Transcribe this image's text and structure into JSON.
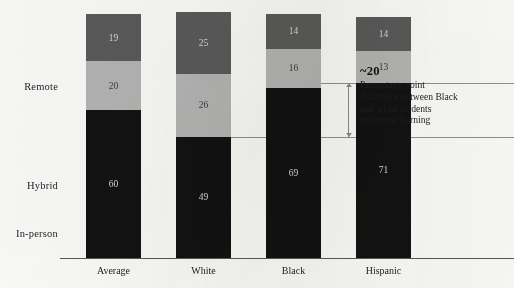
{
  "chart_data": {
    "type": "bar",
    "subtype": "100% stacked bar",
    "title": "",
    "xlabel": "",
    "ylabel": "",
    "ylim": [
      0,
      100
    ],
    "grid": false,
    "legend_position": "left-row-labels",
    "categories": [
      "Average",
      "White",
      "Black",
      "Hispanic"
    ],
    "series": [
      {
        "name": "In-person",
        "color": "#5a5a5a",
        "values": [
          19,
          25,
          14,
          14
        ]
      },
      {
        "name": "Hybrid",
        "color": "#b5b5b5",
        "values": [
          20,
          26,
          16,
          13
        ]
      },
      {
        "name": "Remote",
        "color": "#121212",
        "values": [
          60,
          49,
          69,
          71
        ]
      }
    ],
    "annotations": [
      {
        "value": "~20",
        "text": "Percentage-point difference between Black and white students in remote learning",
        "text_lines": [
          "Percentage-point",
          "difference between Black",
          "and white students",
          "in remote learning"
        ],
        "span_from_category": "White",
        "span_to_category": "Hispanic",
        "marker": "double-arrow"
      }
    ]
  },
  "row_labels": [
    {
      "name": "In-person",
      "label": "In-person"
    },
    {
      "name": "Hybrid",
      "label": "Hybrid"
    },
    {
      "name": "Remote",
      "label": "Remote"
    }
  ],
  "bars": [
    {
      "category": "Average",
      "segments": [
        {
          "series": "In-person",
          "value": 19,
          "label": "19"
        },
        {
          "series": "Hybrid",
          "value": 20,
          "label": "20"
        },
        {
          "series": "Remote",
          "value": 60,
          "label": "60"
        }
      ]
    },
    {
      "category": "White",
      "segments": [
        {
          "series": "In-person",
          "value": 25,
          "label": "25"
        },
        {
          "series": "Hybrid",
          "value": 26,
          "label": "26"
        },
        {
          "series": "Remote",
          "value": 49,
          "label": "49"
        }
      ]
    },
    {
      "category": "Black",
      "segments": [
        {
          "series": "In-person",
          "value": 14,
          "label": "14"
        },
        {
          "series": "Hybrid",
          "value": 16,
          "label": "16"
        },
        {
          "series": "Remote",
          "value": 69,
          "label": "69"
        }
      ]
    },
    {
      "category": "Hispanic",
      "segments": [
        {
          "series": "In-person",
          "value": 14,
          "label": "14"
        },
        {
          "series": "Hybrid",
          "value": 13,
          "label": "13"
        },
        {
          "series": "Remote",
          "value": 71,
          "label": "71"
        }
      ]
    }
  ],
  "category_labels": [
    "Average",
    "White",
    "Black",
    "Hispanic"
  ],
  "annotation": {
    "value": "~20",
    "line1": "Percentage-point",
    "line2": "difference between Black",
    "line3": "and white students",
    "line4": "in remote learning"
  },
  "colors": {
    "in_person": "#5a5a5a",
    "hybrid": "#b5b5b5",
    "remote": "#121212",
    "axis": "#3b3b3b",
    "reference_line": "#8a8a8e",
    "page": "#fbfbf9"
  }
}
